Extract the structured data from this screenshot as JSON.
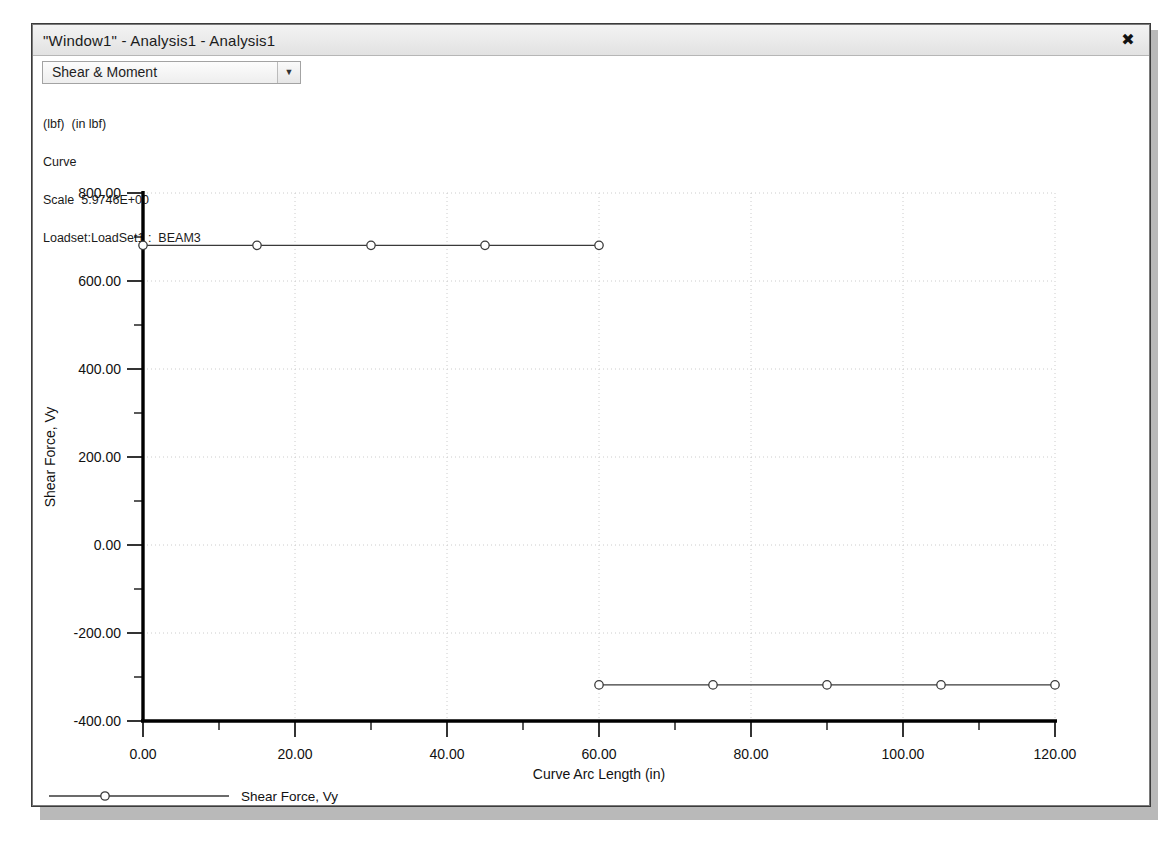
{
  "window": {
    "title": "\"Window1\" - Analysis1 - Analysis1",
    "close_icon": "close-icon",
    "close_glyph": "✖"
  },
  "toolbar": {
    "result_type_selected": "Shear & Moment",
    "dropdown_arrow_glyph": "▼"
  },
  "annotation": {
    "line1": "(lbf)  (in lbf)",
    "line2": "Curve",
    "line3": "Scale  5.9746E+00",
    "line4": "Loadset:LoadSet1 :  BEAM3"
  },
  "legend": {
    "entry_label": "Shear Force, Vy",
    "marker": "circle"
  },
  "colors": {
    "line": "#3a3a3a",
    "axis": "#000000",
    "grid": "#cccccc",
    "text": "#111111",
    "window_frame": "#7a7a7a",
    "titlebar": "#e8e8e8"
  },
  "chart_data": {
    "type": "line",
    "title": "",
    "xlabel": "Curve Arc Length (in)",
    "ylabel": "Shear Force, Vy",
    "xlim": [
      0,
      120
    ],
    "ylim": [
      -400,
      800
    ],
    "xticks": [
      0,
      20,
      40,
      60,
      80,
      100,
      120
    ],
    "xticklabels": [
      "0.00",
      "20.00",
      "40.00",
      "60.00",
      "80.00",
      "100.00",
      "120.00"
    ],
    "yticks": [
      -400,
      -200,
      0,
      200,
      400,
      600,
      800
    ],
    "yticklabels": [
      "-400.00",
      "-200.00",
      "0.00",
      "200.00",
      "400.00",
      "600.00",
      "800.00"
    ],
    "x_minor_step": 10,
    "y_minor_step": 100,
    "grid": true,
    "grid_style": "dotted",
    "legend_position": "below-left",
    "series": [
      {
        "name": "Shear Force, Vy",
        "marker": "circle",
        "segments": [
          {
            "x": [
              0.0,
              15.0,
              30.0,
              45.0,
              60.0
            ],
            "y": [
              681.0,
              681.0,
              681.0,
              681.0,
              681.0
            ]
          },
          {
            "x": [
              60.0,
              75.0,
              90.0,
              105.0,
              120.0
            ],
            "y": [
              -318.0,
              -318.0,
              -318.0,
              -318.0,
              -318.0
            ]
          }
        ]
      }
    ]
  }
}
